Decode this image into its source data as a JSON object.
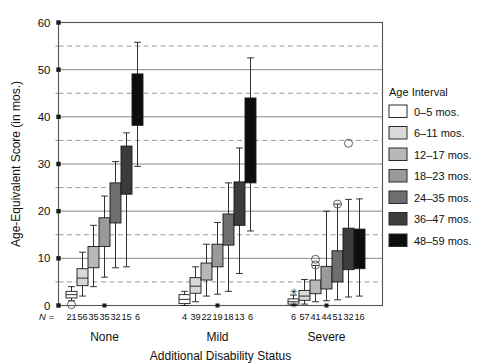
{
  "chart_data": {
    "type": "bar",
    "subtype": "box-and-whisker",
    "title": "",
    "xlabel": "Additional Disability Status",
    "ylabel": "Age-Equivalent Score (in mos.)",
    "ylim": [
      0,
      60
    ],
    "yticks": [
      0,
      10,
      20,
      30,
      40,
      50,
      60
    ],
    "ytick_labels": [
      "0",
      "10",
      "20",
      "30",
      "40",
      "50",
      "60"
    ],
    "minor_gridlines": [
      5,
      15,
      25,
      35,
      45,
      55
    ],
    "grid": true,
    "grid_style_major": "solid",
    "grid_style_minor": "dashed",
    "legend_title": "Age Interval",
    "legend_position": "right",
    "categories": [
      "None",
      "Mild",
      "Severe"
    ],
    "n_label": "N =",
    "series": [
      {
        "name": "0–5 mos.",
        "color": "#ffffff",
        "values": [
          {
            "group": "None",
            "n": 21,
            "q1": 1.6,
            "q3": 3.0,
            "median": 2.3,
            "whisker_low": 1.0,
            "whisker_high": 4.0,
            "outliers": [
              0.2
            ]
          },
          {
            "group": "Mild",
            "n": 4,
            "q1": 0.4,
            "q3": 2.3,
            "median": 1.3,
            "whisker_low": 0.0,
            "whisker_high": 3.0,
            "outliers": []
          },
          {
            "group": "Severe",
            "n": 6,
            "q1": 0.3,
            "q3": 1.4,
            "median": 0.8,
            "whisker_low": 0.0,
            "whisker_high": 2.2,
            "outliers": [
              3.0,
              0.2
            ],
            "outlier_marks": [
              "*",
              "*"
            ]
          }
        ]
      },
      {
        "name": "6–11 mos.",
        "color": "#d9d9d9",
        "values": [
          {
            "group": "None",
            "n": 56,
            "q1": 4.2,
            "q3": 7.8,
            "median": 5.8,
            "whisker_low": 2.0,
            "whisker_high": 11.3,
            "outliers": []
          },
          {
            "group": "Mild",
            "n": 39,
            "q1": 2.6,
            "q3": 5.9,
            "median": 4.1,
            "whisker_low": 0.8,
            "whisker_high": 8.2,
            "outliers": []
          },
          {
            "group": "Severe",
            "n": 57,
            "q1": 1.1,
            "q3": 3.2,
            "median": 2.0,
            "whisker_low": 0.3,
            "whisker_high": 5.5,
            "outliers": []
          }
        ]
      },
      {
        "name": "12–17 mos.",
        "color": "#b8b8b8",
        "values": [
          {
            "group": "None",
            "n": 35,
            "q1": 8.0,
            "q3": 12.5,
            "median": 10.0,
            "whisker_low": 4.0,
            "whisker_high": 17.0,
            "outliers": []
          },
          {
            "group": "Mild",
            "n": 22,
            "q1": 5.4,
            "q3": 9.0,
            "median": 7.0,
            "whisker_low": 2.0,
            "whisker_high": 13.0,
            "outliers": []
          },
          {
            "group": "Severe",
            "n": 41,
            "q1": 2.5,
            "q3": 5.4,
            "median": 3.8,
            "whisker_low": 0.8,
            "whisker_high": 8.5,
            "outliers": [
              9.8,
              8.6
            ]
          }
        ]
      },
      {
        "name": "18–23 mos.",
        "color": "#9a9a9a",
        "values": [
          {
            "group": "None",
            "n": 35,
            "q1": 12.5,
            "q3": 18.6,
            "median": 15.3,
            "whisker_low": 6.0,
            "whisker_high": 23.2,
            "outliers": []
          },
          {
            "group": "Mild",
            "n": 19,
            "q1": 8.2,
            "q3": 13.0,
            "median": 10.3,
            "whisker_low": 2.4,
            "whisker_high": 17.6,
            "outliers": []
          },
          {
            "group": "Severe",
            "n": 44,
            "q1": 3.5,
            "q3": 8.3,
            "median": 5.5,
            "whisker_low": 1.0,
            "whisker_high": 20.0,
            "outliers": []
          }
        ]
      },
      {
        "name": "24–35 mos.",
        "color": "#6e6e6e",
        "values": [
          {
            "group": "None",
            "n": 32,
            "q1": 17.5,
            "q3": 26.0,
            "median": 21.5,
            "whisker_low": 8.0,
            "whisker_high": 30.5,
            "outliers": []
          },
          {
            "group": "Mild",
            "n": 18,
            "q1": 12.8,
            "q3": 19.4,
            "median": 16.0,
            "whisker_low": 3.0,
            "whisker_high": 26.0,
            "outliers": []
          },
          {
            "group": "Severe",
            "n": 51,
            "q1": 5.0,
            "q3": 11.6,
            "median": 8.0,
            "whisker_low": 1.2,
            "whisker_high": 21.5,
            "outliers": [
              21.5
            ]
          }
        ]
      },
      {
        "name": "36–47 mos.",
        "color": "#3c3c3c",
        "values": [
          {
            "group": "None",
            "n": 15,
            "q1": 23.6,
            "q3": 33.8,
            "median": 28.5,
            "whisker_low": 8.2,
            "whisker_high": 36.6,
            "outliers": []
          },
          {
            "group": "Mild",
            "n": 13,
            "q1": 17.0,
            "q3": 26.2,
            "median": 21.5,
            "whisker_low": 6.8,
            "whisker_high": 33.4,
            "outliers": []
          },
          {
            "group": "Severe",
            "n": 32,
            "q1": 7.6,
            "q3": 16.4,
            "median": 11.5,
            "whisker_low": 1.8,
            "whisker_high": 22.5,
            "outliers": [
              34.4
            ]
          }
        ]
      },
      {
        "name": "48–59 mos.",
        "color": "#0d0d0d",
        "values": [
          {
            "group": "None",
            "n": 6,
            "q1": 38.2,
            "q3": 49.1,
            "median": 44.0,
            "whisker_low": 29.5,
            "whisker_high": 55.8,
            "outliers": []
          },
          {
            "group": "Mild",
            "n": 6,
            "q1": 26.0,
            "q3": 44.0,
            "median": 35.0,
            "whisker_low": 15.8,
            "whisker_high": 52.5,
            "outliers": []
          },
          {
            "group": "Severe",
            "n": 16,
            "q1": 7.8,
            "q3": 16.2,
            "median": 12.0,
            "whisker_low": 2.0,
            "whisker_high": 22.6,
            "outliers": []
          }
        ]
      }
    ],
    "n_rows": {
      "None": [
        "21",
        "56",
        "35",
        "35",
        "32",
        "15",
        "6"
      ],
      "Mild": [
        "4",
        "39",
        "22",
        "19",
        "18",
        "13",
        "6"
      ],
      "Severe": [
        "6",
        "57",
        "41",
        "44",
        "51",
        "32",
        "16"
      ]
    }
  },
  "legend": {
    "title": "Age Interval",
    "items": [
      {
        "label": "0–5 mos.",
        "color": "#ffffff"
      },
      {
        "label": "6–11 mos.",
        "color": "#d9d9d9"
      },
      {
        "label": "12–17 mos.",
        "color": "#b8b8b8"
      },
      {
        "label": "18–23 mos.",
        "color": "#9a9a9a"
      },
      {
        "label": "24–35 mos.",
        "color": "#6e6e6e"
      },
      {
        "label": "36–47 mos.",
        "color": "#3c3c3c"
      },
      {
        "label": "48–59 mos.",
        "color": "#0d0d0d"
      }
    ]
  },
  "axes": {
    "y_title": "Age-Equivalent Score (in mos.)",
    "x_title": "Additional Disability Status",
    "y_ticks": [
      "60",
      "50",
      "40",
      "30",
      "20",
      "10",
      "0"
    ],
    "group_labels": [
      "None",
      "Mild",
      "Severe"
    ],
    "n_prefix": "N ="
  },
  "style": {
    "frame_color": "#555555",
    "grid_major_color": "#888888",
    "grid_minor_color": "#999999",
    "box_stroke": "#1a1a1a",
    "text_color": "#111111"
  }
}
